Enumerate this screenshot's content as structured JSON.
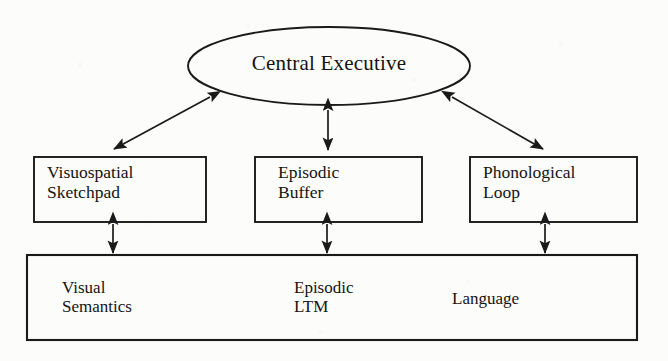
{
  "diagram": {
    "background_color": "#fcfcfb",
    "stroke_color": "#1a1a1a",
    "central_executive": {
      "label": "Central Executive",
      "shape": "ellipse"
    },
    "components": [
      {
        "id": "visuospatial-sketchpad",
        "label": "Visuospatial\nSketchpad",
        "shape": "rectangle"
      },
      {
        "id": "episodic-buffer",
        "label": "Episodic\nBuffer",
        "shape": "rectangle"
      },
      {
        "id": "phonological-loop",
        "label": "Phonological\nLoop",
        "shape": "rectangle"
      }
    ],
    "long_term_memory": {
      "shape": "rectangle",
      "items": [
        {
          "id": "visual-semantics",
          "label": "Visual\nSemantics"
        },
        {
          "id": "episodic-ltm",
          "label": "Episodic\nLTM"
        },
        {
          "id": "language",
          "label": "Language"
        }
      ]
    },
    "connections": [
      {
        "id": "ce-to-visuospatial",
        "from": "central-executive",
        "to": "visuospatial-sketchpad",
        "style": "double-headed-arrow",
        "orientation": "diagonal"
      },
      {
        "id": "ce-to-episodic-buffer",
        "from": "central-executive",
        "to": "episodic-buffer",
        "style": "double-headed-arrow",
        "orientation": "vertical"
      },
      {
        "id": "ce-to-phonological",
        "from": "central-executive",
        "to": "phonological-loop",
        "style": "double-headed-arrow",
        "orientation": "diagonal"
      },
      {
        "id": "visuospatial-to-ltm",
        "from": "visuospatial-sketchpad",
        "to": "visual-semantics",
        "style": "double-headed-arrow",
        "orientation": "vertical"
      },
      {
        "id": "episodic-buffer-to-ltm",
        "from": "episodic-buffer",
        "to": "episodic-ltm",
        "style": "double-headed-arrow",
        "orientation": "vertical"
      },
      {
        "id": "phonological-to-ltm",
        "from": "phonological-loop",
        "to": "language",
        "style": "double-headed-arrow",
        "orientation": "vertical"
      }
    ]
  }
}
